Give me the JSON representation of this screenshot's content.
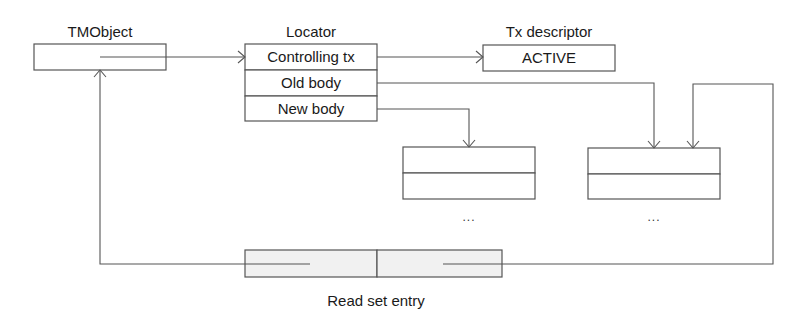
{
  "diagram": {
    "tmobject": {
      "title": "TMObject"
    },
    "locator": {
      "title": "Locator",
      "fields": [
        "Controlling tx",
        "Old body",
        "New body"
      ]
    },
    "tx_descriptor": {
      "title": "Tx descriptor",
      "status": "ACTIVE"
    },
    "new_body_object": {
      "continuation": "..."
    },
    "old_body_object": {
      "continuation": "..."
    },
    "read_set_entry": {
      "title": "Read set entry"
    },
    "colors": {
      "stroke": "#555555",
      "read_set_fill": "#f1f1f1",
      "background": "#ffffff"
    }
  }
}
